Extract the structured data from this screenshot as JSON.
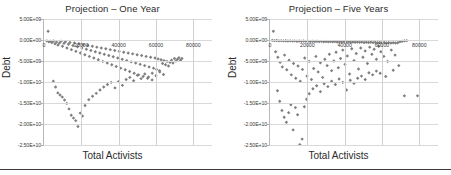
{
  "figure": {
    "background": "#ffffff",
    "marker_color": "#7f7f7f",
    "gridline_color": "#d0d0d0",
    "axis_color": "#b8b8b8",
    "rule_color": "#3c3c3c"
  },
  "panels": [
    {
      "id": "one-year",
      "title": "Projection – One Year"
    },
    {
      "id": "five-years",
      "title": "Projection – Five Years"
    }
  ],
  "chart_data": [
    {
      "type": "scatter",
      "title": "Projection – One Year",
      "xlabel": "Total Activists",
      "ylabel": "Debt",
      "xlim": [
        0,
        90000
      ],
      "ylim": [
        -25000000000,
        5000000000
      ],
      "grid": true,
      "legend": "none",
      "marker": "diamond",
      "marker_color": "#7f7f7f",
      "xticks": [
        0,
        20000,
        40000,
        60000,
        80000
      ],
      "xticklabels": [
        "0",
        "20000",
        "40000",
        "60000",
        "80000"
      ],
      "yticks": [
        5000000000,
        0,
        -5000000000,
        -10000000000,
        -15000000000,
        -20000000000,
        -25000000000
      ],
      "yticklabels": [
        "5.00E+09",
        "0.00E+00",
        "-5.00E+09",
        "-1.00E+10",
        "-1.50E+10",
        "-2.00E+10",
        "-2.50E+10"
      ],
      "points": [
        [
          2200,
          2100000000
        ],
        [
          1500,
          -200000000
        ],
        [
          2600,
          -400000000
        ],
        [
          3400,
          -300000000
        ],
        [
          4200,
          -600000000
        ],
        [
          5100,
          -250000000
        ],
        [
          5900,
          -900000000
        ],
        [
          6700,
          -500000000
        ],
        [
          7500,
          -1200000000
        ],
        [
          8300,
          -700000000
        ],
        [
          9100,
          -300000000
        ],
        [
          9900,
          -1500000000
        ],
        [
          10700,
          -800000000
        ],
        [
          11500,
          -400000000
        ],
        [
          12300,
          -1900000000
        ],
        [
          13100,
          -1000000000
        ],
        [
          13900,
          -600000000
        ],
        [
          14700,
          -2300000000
        ],
        [
          15500,
          -1300000000
        ],
        [
          16300,
          -700000000
        ],
        [
          17100,
          -2700000000
        ],
        [
          17900,
          -1600000000
        ],
        [
          18700,
          -900000000
        ],
        [
          19500,
          -3100000000
        ],
        [
          20300,
          -1900000000
        ],
        [
          21100,
          -1100000000
        ],
        [
          21900,
          -3500000000
        ],
        [
          22700,
          -2200000000
        ],
        [
          23500,
          -1300000000
        ],
        [
          24300,
          -3900000000
        ],
        [
          25100,
          -2500000000
        ],
        [
          25900,
          -1500000000
        ],
        [
          26700,
          -4300000000
        ],
        [
          27500,
          -2800000000
        ],
        [
          28300,
          -1700000000
        ],
        [
          29100,
          -4700000000
        ],
        [
          29900,
          -3100000000
        ],
        [
          30700,
          -1900000000
        ],
        [
          31500,
          -5100000000
        ],
        [
          32300,
          -3400000000
        ],
        [
          33100,
          -2100000000
        ],
        [
          33900,
          -5500000000
        ],
        [
          34700,
          -3700000000
        ],
        [
          35500,
          -2300000000
        ],
        [
          36300,
          -5900000000
        ],
        [
          37100,
          -4000000000
        ],
        [
          37900,
          -2500000000
        ],
        [
          38700,
          -6300000000
        ],
        [
          39500,
          -4300000000
        ],
        [
          40300,
          -2700000000
        ],
        [
          41100,
          -6700000000
        ],
        [
          41900,
          -4600000000
        ],
        [
          42700,
          -2900000000
        ],
        [
          43500,
          -7100000000
        ],
        [
          44300,
          -4900000000
        ],
        [
          45100,
          -3100000000
        ],
        [
          45900,
          -7500000000
        ],
        [
          46700,
          -5200000000
        ],
        [
          47500,
          -3300000000
        ],
        [
          48300,
          -7900000000
        ],
        [
          49100,
          -5500000000
        ],
        [
          49900,
          -3500000000
        ],
        [
          50700,
          -8300000000
        ],
        [
          51500,
          -5800000000
        ],
        [
          52300,
          -3700000000
        ],
        [
          53100,
          -8700000000
        ],
        [
          53900,
          -6100000000
        ],
        [
          54700,
          -3900000000
        ],
        [
          55500,
          -9100000000
        ],
        [
          56300,
          -6400000000
        ],
        [
          57100,
          -4100000000
        ],
        [
          57900,
          -9500000000
        ],
        [
          58700,
          -6700000000
        ],
        [
          59500,
          -4300000000
        ],
        [
          60300,
          -7000000000
        ],
        [
          61100,
          -4500000000
        ],
        [
          61900,
          -7300000000
        ],
        [
          62700,
          -4700000000
        ],
        [
          63500,
          -5600000000
        ],
        [
          64300,
          -4900000000
        ],
        [
          65100,
          -5900000000
        ],
        [
          65900,
          -5100000000
        ],
        [
          66700,
          -6200000000
        ],
        [
          67500,
          -5300000000
        ],
        [
          68300,
          -4800000000
        ],
        [
          69100,
          -5500000000
        ],
        [
          69900,
          -4400000000
        ],
        [
          70700,
          -5000000000
        ],
        [
          71500,
          -4600000000
        ],
        [
          72300,
          -4200000000
        ],
        [
          73100,
          -4800000000
        ],
        [
          73900,
          -4400000000
        ],
        [
          5000,
          -9800000000
        ],
        [
          6200,
          -11200000000
        ],
        [
          7400,
          -12600000000
        ],
        [
          8600,
          -13100000000
        ],
        [
          9800,
          -13600000000
        ],
        [
          11000,
          -14300000000
        ],
        [
          12200,
          -15100000000
        ],
        [
          13400,
          -16400000000
        ],
        [
          14600,
          -17900000000
        ],
        [
          15800,
          -18600000000
        ],
        [
          17000,
          -19200000000
        ],
        [
          18200,
          -20600000000
        ],
        [
          19400,
          -17400000000
        ],
        [
          20600,
          -18100000000
        ],
        [
          22000,
          -15600000000
        ],
        [
          24000,
          -14200000000
        ],
        [
          26000,
          -13400000000
        ],
        [
          28000,
          -12700000000
        ],
        [
          30000,
          -11900000000
        ],
        [
          32000,
          -11200000000
        ],
        [
          34000,
          -10600000000
        ],
        [
          36000,
          -10100000000
        ],
        [
          38000,
          -11400000000
        ],
        [
          40000,
          -9900000000
        ],
        [
          42000,
          -10800000000
        ],
        [
          44000,
          -9400000000
        ],
        [
          46000,
          -8900000000
        ],
        [
          48000,
          -9700000000
        ],
        [
          50000,
          -8400000000
        ],
        [
          52000,
          -9200000000
        ],
        [
          54000,
          -8100000000
        ],
        [
          56000,
          -8800000000
        ],
        [
          58000,
          -7900000000
        ],
        [
          60000,
          -8500000000
        ],
        [
          62000,
          -7600000000
        ],
        [
          64000,
          -8200000000
        ]
      ]
    },
    {
      "type": "scatter",
      "title": "Projection – Five Years",
      "xlabel": "Total Activists",
      "ylabel": "Debt",
      "xlim": [
        0,
        90000
      ],
      "ylim": [
        -25000000000,
        5000000000
      ],
      "grid": true,
      "legend": "none",
      "marker": "diamond",
      "marker_color": "#7f7f7f",
      "xticks": [
        0,
        20000,
        40000,
        60000,
        80000
      ],
      "xticklabels": [
        "0",
        "20000",
        "40000",
        "60000",
        "80000"
      ],
      "yticks": [
        5000000000,
        0,
        -5000000000,
        -10000000000,
        -15000000000,
        -20000000000,
        -25000000000
      ],
      "yticklabels": [
        "5.00E+09",
        "0.00E+00",
        "-5.00E+09",
        "-1.00E+10",
        "-1.50E+10",
        "-2.00E+10",
        "-2.50E+10"
      ],
      "points": [
        [
          1800,
          2100000000
        ],
        [
          1200,
          -100000000
        ],
        [
          2400,
          -150000000
        ],
        [
          3600,
          -120000000
        ],
        [
          4800,
          -200000000
        ],
        [
          6000,
          -160000000
        ],
        [
          7200,
          -220000000
        ],
        [
          8400,
          -180000000
        ],
        [
          9600,
          -240000000
        ],
        [
          10800,
          -200000000
        ],
        [
          12000,
          -260000000
        ],
        [
          13200,
          -210000000
        ],
        [
          14400,
          -280000000
        ],
        [
          15600,
          -230000000
        ],
        [
          16800,
          -300000000
        ],
        [
          18000,
          -250000000
        ],
        [
          19200,
          -320000000
        ],
        [
          20400,
          -270000000
        ],
        [
          21600,
          -340000000
        ],
        [
          22800,
          -290000000
        ],
        [
          24000,
          -360000000
        ],
        [
          25200,
          -300000000
        ],
        [
          26400,
          -380000000
        ],
        [
          27600,
          -320000000
        ],
        [
          28800,
          -400000000
        ],
        [
          30000,
          -340000000
        ],
        [
          31200,
          -420000000
        ],
        [
          32400,
          -360000000
        ],
        [
          33600,
          -440000000
        ],
        [
          34800,
          -380000000
        ],
        [
          36000,
          -460000000
        ],
        [
          37200,
          -400000000
        ],
        [
          38400,
          -480000000
        ],
        [
          39600,
          -420000000
        ],
        [
          40800,
          -500000000
        ],
        [
          42000,
          -440000000
        ],
        [
          43200,
          -520000000
        ],
        [
          44400,
          -460000000
        ],
        [
          45600,
          -540000000
        ],
        [
          46800,
          -480000000
        ],
        [
          48000,
          -560000000
        ],
        [
          49200,
          -500000000
        ],
        [
          50400,
          -580000000
        ],
        [
          51600,
          -520000000
        ],
        [
          52800,
          -600000000
        ],
        [
          54000,
          -540000000
        ],
        [
          55200,
          -620000000
        ],
        [
          56400,
          -560000000
        ],
        [
          57600,
          -640000000
        ],
        [
          58800,
          -580000000
        ],
        [
          60000,
          -660000000
        ],
        [
          61200,
          -600000000
        ],
        [
          62400,
          -680000000
        ],
        [
          63600,
          -620000000
        ],
        [
          64800,
          -700000000
        ],
        [
          66000,
          -640000000
        ],
        [
          67200,
          -720000000
        ],
        [
          68400,
          -660000000
        ],
        [
          69600,
          -400000000
        ],
        [
          70800,
          -300000000
        ],
        [
          72000,
          -200000000
        ],
        [
          73200,
          -150000000
        ],
        [
          3000,
          -2800000000
        ],
        [
          4200,
          -4100000000
        ],
        [
          5400,
          -5300000000
        ],
        [
          6600,
          -6400000000
        ],
        [
          7800,
          -3600000000
        ],
        [
          9000,
          -7100000000
        ],
        [
          10200,
          -4800000000
        ],
        [
          11400,
          -8300000000
        ],
        [
          12600,
          -5600000000
        ],
        [
          13800,
          -9100000000
        ],
        [
          15000,
          -6200000000
        ],
        [
          16200,
          -9800000000
        ],
        [
          17400,
          -7000000000
        ],
        [
          18600,
          -4300000000
        ],
        [
          19800,
          -8600000000
        ],
        [
          21000,
          -5100000000
        ],
        [
          22200,
          -9400000000
        ],
        [
          23400,
          -6800000000
        ],
        [
          24600,
          -3900000000
        ],
        [
          25800,
          -7600000000
        ],
        [
          27000,
          -5400000000
        ],
        [
          28200,
          -8900000000
        ],
        [
          29400,
          -4600000000
        ],
        [
          30600,
          -6100000000
        ],
        [
          31800,
          -3400000000
        ],
        [
          33000,
          -7300000000
        ],
        [
          34200,
          -5000000000
        ],
        [
          35400,
          -2900000000
        ],
        [
          36600,
          -6600000000
        ],
        [
          37800,
          -4400000000
        ],
        [
          39000,
          -2400000000
        ],
        [
          40200,
          -5800000000
        ],
        [
          41400,
          -3800000000
        ],
        [
          42600,
          -8100000000
        ],
        [
          43800,
          -2100000000
        ],
        [
          45000,
          -4900000000
        ],
        [
          46200,
          -3200000000
        ],
        [
          47400,
          -6900000000
        ],
        [
          48600,
          -1900000000
        ],
        [
          49800,
          -4100000000
        ],
        [
          51000,
          -2600000000
        ],
        [
          52200,
          -5600000000
        ],
        [
          53400,
          -1700000000
        ],
        [
          54600,
          -3400000000
        ],
        [
          55800,
          -2200000000
        ],
        [
          57000,
          -4600000000
        ],
        [
          58200,
          -1500000000
        ],
        [
          59400,
          -2800000000
        ],
        [
          61000,
          -3900000000
        ],
        [
          63000,
          -5100000000
        ],
        [
          65000,
          -2400000000
        ],
        [
          67000,
          -3600000000
        ],
        [
          69000,
          -6100000000
        ],
        [
          72000,
          -13300000000
        ],
        [
          79000,
          -13300000000
        ],
        [
          4000,
          -12100000000
        ],
        [
          5200,
          -14600000000
        ],
        [
          6400,
          -16800000000
        ],
        [
          7600,
          -18400000000
        ],
        [
          8800,
          -19600000000
        ],
        [
          10000,
          -17300000000
        ],
        [
          11200,
          -15400000000
        ],
        [
          12400,
          -21400000000
        ],
        [
          13600,
          -16100000000
        ],
        [
          14800,
          -17800000000
        ],
        [
          16000,
          -24900000000
        ],
        [
          17200,
          -23600000000
        ],
        [
          18400,
          -15900000000
        ],
        [
          19600,
          -14100000000
        ],
        [
          21000,
          -12800000000
        ],
        [
          23000,
          -11600000000
        ],
        [
          25000,
          -10900000000
        ],
        [
          27000,
          -12300000000
        ],
        [
          29000,
          -10400000000
        ],
        [
          31000,
          -11100000000
        ],
        [
          33000,
          -9800000000
        ],
        [
          35000,
          -10600000000
        ],
        [
          37000,
          -9300000000
        ],
        [
          39000,
          -10100000000
        ],
        [
          41000,
          -11900000000
        ],
        [
          43000,
          -9600000000
        ],
        [
          45000,
          -10300000000
        ],
        [
          47000,
          -9100000000
        ],
        [
          49000,
          -8600000000
        ],
        [
          51000,
          -9400000000
        ],
        [
          53000,
          -7800000000
        ],
        [
          55000,
          -8300000000
        ],
        [
          57000,
          -7400000000
        ],
        [
          59000,
          -7900000000
        ],
        [
          62000,
          -8700000000
        ],
        [
          66000,
          -7200000000
        ]
      ]
    }
  ]
}
